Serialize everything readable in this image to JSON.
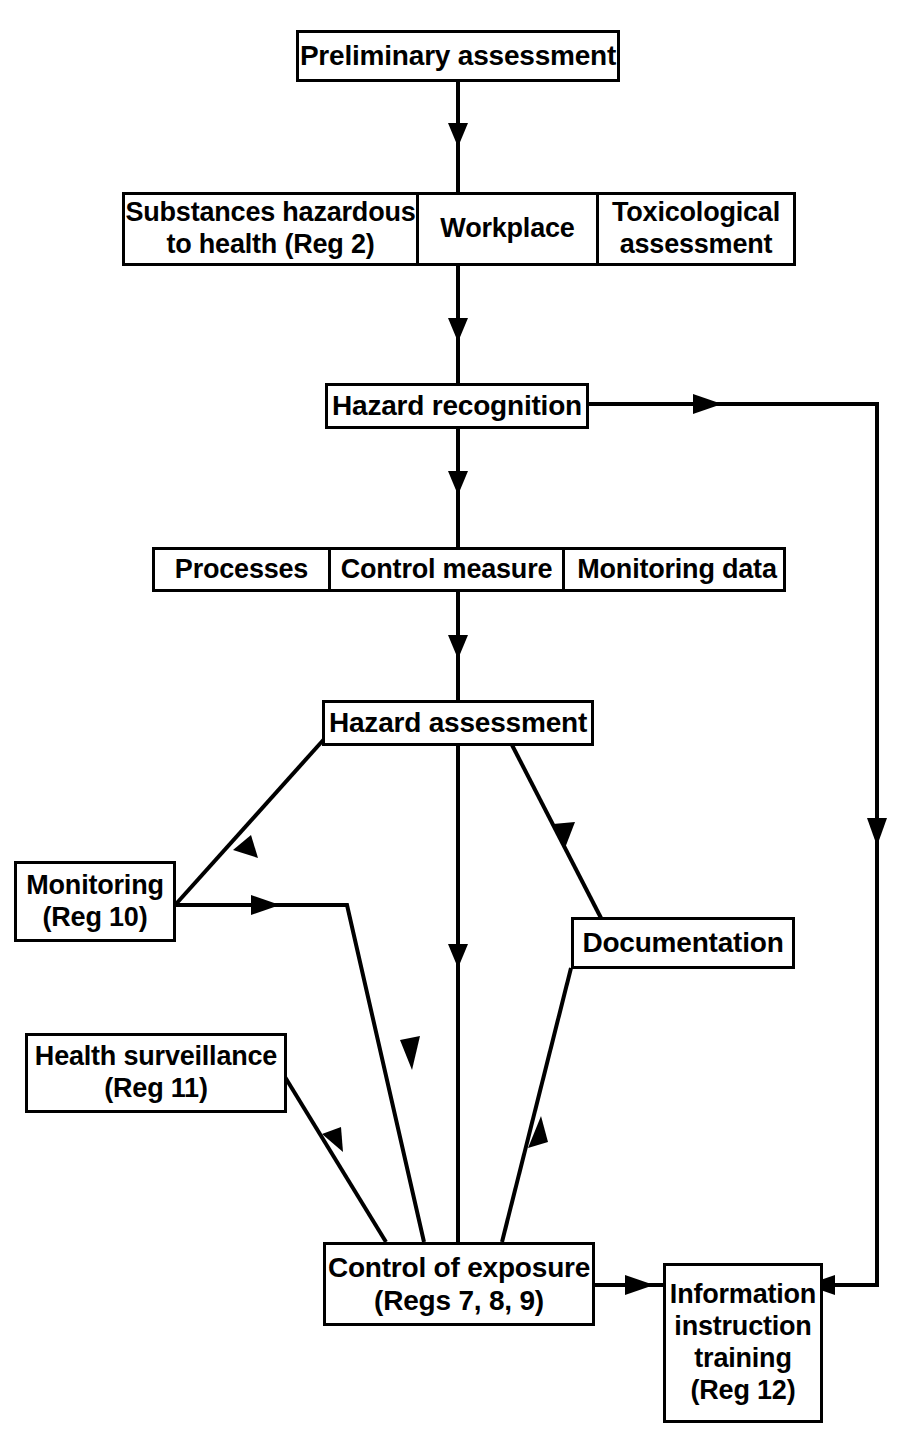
{
  "diagram": {
    "line_color": "#000000",
    "background_color": "#ffffff",
    "nodes": [
      {
        "id": "preliminary",
        "label": "Preliminary assessment"
      },
      {
        "id": "substances",
        "label": "Substances hazardous\nto health (Reg 2)"
      },
      {
        "id": "workplace",
        "label": "Workplace"
      },
      {
        "id": "toxicological",
        "label": "Toxicological\nassessment"
      },
      {
        "id": "hazard_recog",
        "label": "Hazard recognition"
      },
      {
        "id": "processes",
        "label": "Processes"
      },
      {
        "id": "control_meas",
        "label": "Control measure"
      },
      {
        "id": "monitor_data",
        "label": "Monitoring data"
      },
      {
        "id": "hazard_assess",
        "label": "Hazard assessment"
      },
      {
        "id": "monitoring",
        "label": "Monitoring\n(Reg 10)"
      },
      {
        "id": "documentation",
        "label": "Documentation"
      },
      {
        "id": "health_surv",
        "label": "Health surveillance\n(Reg 11)"
      },
      {
        "id": "control_exp",
        "label": "Control of exposure\n(Regs 7, 8, 9)"
      },
      {
        "id": "info_train",
        "label": "Information\ninstruction\ntraining\n(Reg 12)"
      }
    ],
    "edges": [
      {
        "from": "preliminary",
        "to": "substances_row",
        "style": "straight-down"
      },
      {
        "from": "substances_row",
        "to": "hazard_recog",
        "style": "straight-down"
      },
      {
        "from": "hazard_recog",
        "to": "processes_row",
        "style": "straight-down"
      },
      {
        "from": "processes_row",
        "to": "hazard_assess",
        "style": "straight-down"
      },
      {
        "from": "hazard_assess",
        "to": "control_exp",
        "style": "straight-down"
      },
      {
        "from": "hazard_recog",
        "to": "info_train",
        "style": "right-elbow-down"
      },
      {
        "from": "monitoring",
        "to": "hazard_assess",
        "style": "diagonal-up-right"
      },
      {
        "from": "monitoring",
        "to": "control_exp",
        "style": "elbow-diagonal-down"
      },
      {
        "from": "health_surv",
        "to": "control_exp",
        "style": "diagonal-down-right"
      },
      {
        "from": "hazard_assess",
        "to": "documentation",
        "style": "diagonal-down-right"
      },
      {
        "from": "control_exp",
        "to": "documentation",
        "style": "diagonal-up-right"
      },
      {
        "from": "control_exp",
        "to": "info_train",
        "style": "right-arrow"
      }
    ]
  }
}
